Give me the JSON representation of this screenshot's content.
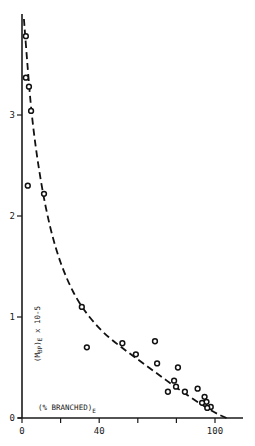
{
  "chart_data": {
    "type": "scatter",
    "title": "",
    "xlabel": "(% BRANCHED)E",
    "ylabel": "(M̄BP)E x 10-5",
    "xlim": [
      0,
      115
    ],
    "ylim": [
      0,
      4
    ],
    "x_ticks": [
      0,
      20,
      40,
      60,
      80,
      100
    ],
    "x_tick_labels": [
      "0",
      "",
      "40",
      "",
      "",
      "100"
    ],
    "y_ticks": [
      0,
      1,
      2,
      3
    ],
    "y_tick_labels": [
      "0",
      "1",
      "2",
      "3"
    ],
    "grid": false,
    "legend": null,
    "series": [
      {
        "name": "observed",
        "kind": "scatter",
        "marker": "open-circle",
        "points": [
          {
            "x": 2,
            "y": 3.78
          },
          {
            "x": 2,
            "y": 3.37
          },
          {
            "x": 3.6,
            "y": 3.28
          },
          {
            "x": 4.7,
            "y": 3.04
          },
          {
            "x": 3,
            "y": 2.3
          },
          {
            "x": 11.4,
            "y": 2.22
          },
          {
            "x": 31,
            "y": 1.1
          },
          {
            "x": 33.6,
            "y": 0.7
          },
          {
            "x": 52,
            "y": 0.74
          },
          {
            "x": 59,
            "y": 0.63
          },
          {
            "x": 68.9,
            "y": 0.76
          },
          {
            "x": 70,
            "y": 0.54
          },
          {
            "x": 80.8,
            "y": 0.5
          },
          {
            "x": 78.8,
            "y": 0.37
          },
          {
            "x": 79.8,
            "y": 0.31
          },
          {
            "x": 75.6,
            "y": 0.26
          },
          {
            "x": 84.4,
            "y": 0.26
          },
          {
            "x": 91,
            "y": 0.29
          },
          {
            "x": 94.6,
            "y": 0.21
          },
          {
            "x": 95.6,
            "y": 0.16
          },
          {
            "x": 93.3,
            "y": 0.15
          },
          {
            "x": 97.8,
            "y": 0.11
          },
          {
            "x": 96,
            "y": 0.1
          }
        ]
      },
      {
        "name": "fitted curve",
        "kind": "line",
        "style": "dashed",
        "points": [
          {
            "x": 1,
            "y": 3.95
          },
          {
            "x": 3,
            "y": 3.45
          },
          {
            "x": 5,
            "y": 3.0
          },
          {
            "x": 8,
            "y": 2.55
          },
          {
            "x": 12,
            "y": 2.1
          },
          {
            "x": 17,
            "y": 1.7
          },
          {
            "x": 23,
            "y": 1.38
          },
          {
            "x": 30,
            "y": 1.12
          },
          {
            "x": 40,
            "y": 0.88
          },
          {
            "x": 50,
            "y": 0.72
          },
          {
            "x": 60,
            "y": 0.58
          },
          {
            "x": 70,
            "y": 0.44
          },
          {
            "x": 80,
            "y": 0.3
          },
          {
            "x": 90,
            "y": 0.17
          },
          {
            "x": 100,
            "y": 0.05
          },
          {
            "x": 106,
            "y": 0.0
          }
        ]
      }
    ]
  },
  "labels": {
    "x_axis_label": "(% BRANCHED)",
    "x_axis_sub": "E",
    "y_axis_label_pre": "(M",
    "y_axis_sub_bp": "BP",
    "y_axis_label_post": ")",
    "y_axis_sub_e": "E",
    "y_axis_mult": " x 10-5"
  }
}
